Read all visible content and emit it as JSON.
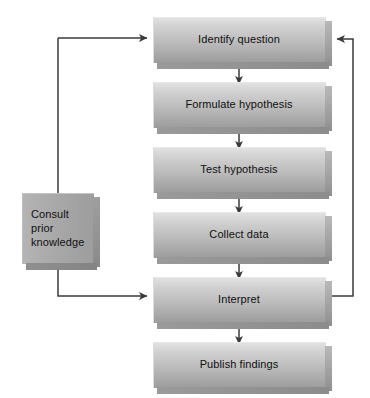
{
  "diagram": {
    "background_color": "#ffffff",
    "line_color": "#3a3a3a",
    "box_fill_light": "#e2e2e2",
    "box_fill_dark": "#9c9c9c",
    "aside_fill": "#a9a9a9",
    "text_color": "#101010",
    "nodes": [
      {
        "id": "identify",
        "label": "Identify question"
      },
      {
        "id": "formulate",
        "label": "Formulate hypothesis"
      },
      {
        "id": "test",
        "label": "Test hypothesis"
      },
      {
        "id": "collect",
        "label": "Collect data"
      },
      {
        "id": "interpret",
        "label": "Interpret"
      },
      {
        "id": "publish",
        "label": "Publish findings"
      }
    ],
    "aside": {
      "id": "consult",
      "label": "Consult\nprior\nknowledge"
    },
    "edges": [
      {
        "from": "identify",
        "to": "formulate",
        "kind": "straight-down"
      },
      {
        "from": "formulate",
        "to": "test",
        "kind": "straight-down"
      },
      {
        "from": "test",
        "to": "collect",
        "kind": "straight-down"
      },
      {
        "from": "collect",
        "to": "interpret",
        "kind": "straight-down"
      },
      {
        "from": "interpret",
        "to": "publish",
        "kind": "straight-down"
      },
      {
        "from": "identify",
        "to": "interpret",
        "kind": "left-loop-down",
        "via": "consult"
      },
      {
        "from": "interpret",
        "to": "identify",
        "kind": "right-loop-up"
      }
    ]
  }
}
